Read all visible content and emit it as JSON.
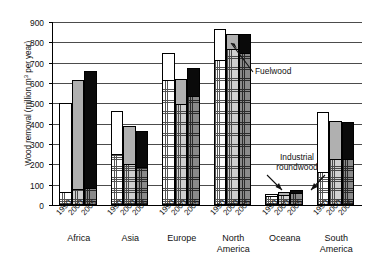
{
  "chart_data": {
    "type": "bar",
    "title": "",
    "subtitle": "",
    "xlabel": "",
    "ylabel": "Wood removal (million m³ per year)",
    "ylim": [
      0,
      900
    ],
    "ytick_step": 100,
    "yticks": [
      0,
      100,
      200,
      300,
      400,
      500,
      600,
      700,
      800,
      900
    ],
    "ytick_labels": [
      "0",
      "100",
      "200",
      "300",
      "400",
      "500",
      "600",
      "700",
      "800",
      "900"
    ],
    "grid": true,
    "grid_axis": "y",
    "legend": "none",
    "stacked": true,
    "categories": [
      "Africa",
      "Asia",
      "Europe",
      "North America",
      "Oceana",
      "South America"
    ],
    "year_labels": [
      "1990",
      "2000",
      "2005"
    ],
    "series": [
      {
        "name": "Fuelwood",
        "note": "lower stacked segment of each bar",
        "values": [
          [
            55,
            68,
            75
          ],
          [
            245,
            195,
            180
          ],
          [
            615,
            495,
            535
          ],
          [
            710,
            765,
            745
          ],
          [
            40,
            48,
            58
          ],
          [
            155,
            220,
            222
          ]
        ]
      },
      {
        "name": "Industrial roundwood",
        "note": "upper stacked segment of each bar",
        "values": [
          [
            445,
            547,
            585
          ],
          [
            215,
            195,
            185
          ],
          [
            135,
            125,
            140
          ],
          [
            155,
            75,
            95
          ],
          [
            12,
            14,
            14
          ],
          [
            303,
            192,
            188
          ]
        ]
      }
    ],
    "totals": [
      [
        500,
        615,
        660
      ],
      [
        460,
        390,
        365
      ],
      [
        750,
        620,
        675
      ],
      [
        865,
        840,
        840
      ],
      [
        52,
        62,
        72
      ],
      [
        458,
        412,
        410
      ]
    ],
    "annotations": [
      {
        "label": "Fuelwood",
        "points_to": "top segment of North America 2005 bar"
      },
      {
        "label": "Industrial",
        "points_to": "Oceana bars and South America 1990 bar"
      },
      {
        "label": "roundwood",
        "points_to": "Oceana bars and South America 1990 bar"
      }
    ],
    "colors": {
      "fuelwood_1990": "#ffffff",
      "fuelwood_2000": "#cfcfcf",
      "fuelwood_2005": "#8a8a8a",
      "industrial_1990": "#ffffff",
      "industrial_2000": "#b0b0b0",
      "industrial_2005": "#0a0a0a",
      "axis": "#000000",
      "gridline": "#4c4c4c"
    }
  },
  "annotations": {
    "fuelwood": "Fuelwood",
    "industrial_line1": "Industrial",
    "industrial_line2": "roundwood"
  }
}
